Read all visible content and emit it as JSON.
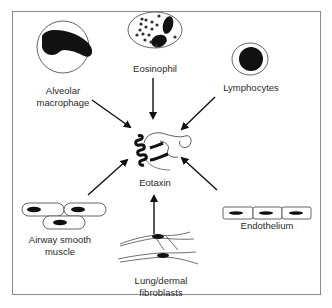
{
  "diagram": {
    "title": "",
    "center": {
      "label": "Eotaxin",
      "icon": "protein-structure-icon"
    },
    "sources": [
      {
        "id": "alveolar-macrophage",
        "line1": "Alveolar",
        "line2": "macrophage",
        "icon": "macrophage-cell-icon"
      },
      {
        "id": "eosinophil",
        "line1": "Eosinophil",
        "line2": "",
        "icon": "eosinophil-cell-icon"
      },
      {
        "id": "lymphocytes",
        "line1": "Lymphocytes",
        "line2": "",
        "icon": "lymphocyte-cell-icon"
      },
      {
        "id": "airway-smooth-muscle",
        "line1": "Airway smooth",
        "line2": "muscle",
        "icon": "smooth-muscle-cells-icon"
      },
      {
        "id": "lung-dermal-fibroblasts",
        "line1": "Lung/dermal",
        "line2": "fibroblasts",
        "icon": "fibroblasts-icon"
      },
      {
        "id": "endothelium",
        "line1": "Endothelium",
        "line2": "",
        "icon": "endothelium-cells-icon"
      }
    ],
    "edges": [
      {
        "from": "alveolar-macrophage",
        "to": "eotaxin"
      },
      {
        "from": "eosinophil",
        "to": "eotaxin"
      },
      {
        "from": "lymphocytes",
        "to": "eotaxin"
      },
      {
        "from": "airway-smooth-muscle",
        "to": "eotaxin"
      },
      {
        "from": "lung-dermal-fibroblasts",
        "to": "eotaxin"
      },
      {
        "from": "endothelium",
        "to": "eotaxin"
      }
    ],
    "colors": {
      "ink": "#111111",
      "outline": "#555555",
      "frame": "#8a8a8a",
      "text": "#2a2a2a"
    }
  }
}
